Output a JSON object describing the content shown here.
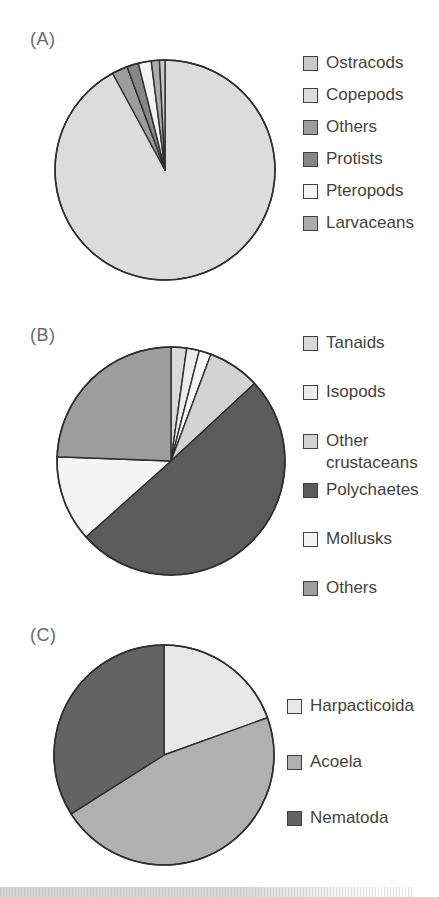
{
  "panels": [
    {
      "label": "(A)"
    },
    {
      "label": "(B)"
    },
    {
      "label": "(C)"
    }
  ],
  "colors": {
    "slice_stroke": "#2f2f2f",
    "legend_text": "#424242",
    "panel_label_text": "#6a6a6a",
    "swatch_border": "#3f3f3f"
  },
  "chart_data": [
    {
      "id": "A",
      "type": "pie",
      "start_angle_deg": 0,
      "direction": "clockwise",
      "legend_position": "right",
      "slices": [
        {
          "label": "Copepods",
          "value": 92.1,
          "color": "#dcdcdc"
        },
        {
          "label": "Others",
          "value": 2.3,
          "color": "#9d9d9d"
        },
        {
          "label": "Protists",
          "value": 1.7,
          "color": "#878787"
        },
        {
          "label": "Pteropods",
          "value": 1.9,
          "color": "#f2f2f2"
        },
        {
          "label": "Larvaceans",
          "value": 1.2,
          "color": "#ababab"
        },
        {
          "label": "Ostracods",
          "value": 0.8,
          "color": "#cacaca"
        }
      ],
      "legend_entries": [
        "Ostracods",
        "Copepods",
        "Others",
        "Protists",
        "Pteropods",
        "Larvaceans"
      ]
    },
    {
      "id": "B",
      "type": "pie",
      "start_angle_deg": 0,
      "direction": "clockwise",
      "legend_position": "right",
      "slices": [
        {
          "label": "Tanaids",
          "value": 2.2,
          "color": "#d9d9d9"
        },
        {
          "label": "Isopods",
          "value": 1.8,
          "color": "#ececec"
        },
        {
          "label": "",
          "value": 1.7,
          "color": "#f7f7f7"
        },
        {
          "label": "Other crustaceans",
          "value": 7.4,
          "color": "#d3d3d3"
        },
        {
          "label": "Polychaetes",
          "value": 50.3,
          "color": "#5c5c5c"
        },
        {
          "label": "Mollusks",
          "value": 12.2,
          "color": "#f4f4f4"
        },
        {
          "label": "Others",
          "value": 24.4,
          "color": "#9d9d9d"
        }
      ],
      "legend_entries": [
        "Tanaids",
        "Isopods",
        "Other crustaceans",
        "Polychaetes",
        "Mollusks",
        "Others"
      ]
    },
    {
      "id": "C",
      "type": "pie",
      "start_angle_deg": 0,
      "direction": "clockwise",
      "legend_position": "right",
      "slices": [
        {
          "label": "Harpacticoida",
          "value": 19.5,
          "color": "#e8e8e8"
        },
        {
          "label": "Acoela",
          "value": 46.5,
          "color": "#b0b0b0"
        },
        {
          "label": "Nematoda",
          "value": 34.0,
          "color": "#636363"
        }
      ],
      "legend_entries": [
        "Harpacticoida",
        "Acoela",
        "Nematoda"
      ]
    }
  ]
}
